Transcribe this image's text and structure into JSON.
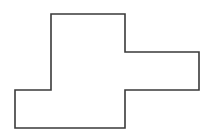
{
  "diagram": {
    "type": "polygon-outline",
    "stroke_color": "#3a3a3a",
    "stroke_width": 1.6,
    "fill_color": "#ffffff",
    "background": "#ffffff",
    "vertices": [
      [
        51,
        14
      ],
      [
        125,
        14
      ],
      [
        125,
        52
      ],
      [
        199,
        52
      ],
      [
        199,
        90
      ],
      [
        125,
        90
      ],
      [
        125,
        128
      ],
      [
        15,
        128
      ],
      [
        15,
        90
      ],
      [
        51,
        90
      ]
    ]
  }
}
